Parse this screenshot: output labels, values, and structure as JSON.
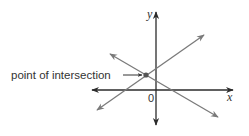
{
  "diagram": {
    "annotation": "point of intersection",
    "origin_label": "0",
    "x_axis_label": "x",
    "y_axis_label": "y",
    "colors": {
      "axis": "#2b2b2b",
      "lines": "#7a7a7a",
      "point": "#555555",
      "text": "#333333"
    }
  }
}
